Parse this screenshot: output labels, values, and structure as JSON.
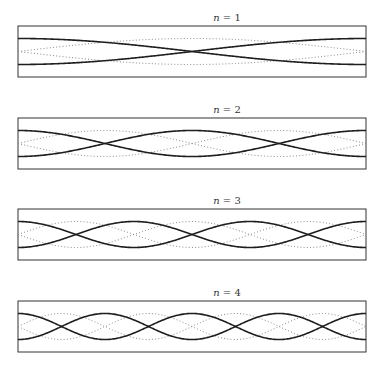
{
  "figure": {
    "width": 381,
    "height": 369,
    "box_left": 18,
    "box_right": 366,
    "box_height": 51,
    "amplitude": 13,
    "label_x": 227,
    "colors": {
      "solid": "#1e1e1e",
      "dotted": "#888888",
      "frame": "#333333"
    },
    "panels": [
      {
        "label_var": "n",
        "label_rest": " = 1",
        "n": 1,
        "box_top": 26,
        "label_y": 21
      },
      {
        "label_var": "n",
        "label_rest": " = 2",
        "n": 2,
        "box_top": 118,
        "label_y": 113
      },
      {
        "label_var": "n",
        "label_rest": " = 3",
        "n": 3,
        "box_top": 209,
        "label_y": 204
      },
      {
        "label_var": "n",
        "label_rest": " = 4",
        "n": 4,
        "box_top": 301,
        "label_y": 296
      }
    ]
  },
  "chart_data": {
    "type": "line",
    "title": "",
    "panels": [
      {
        "title": "n = 1",
        "series": [
          {
            "name": "solid (±cos)",
            "function": "±A·cos(1πx/L)"
          },
          {
            "name": "dotted (±sin)",
            "function": "±A·sin(1πx/L)"
          }
        ]
      },
      {
        "title": "n = 2",
        "series": [
          {
            "name": "solid (±cos)",
            "function": "±A·cos(2πx/L)"
          },
          {
            "name": "dotted (±sin)",
            "function": "±A·sin(2πx/L)"
          }
        ]
      },
      {
        "title": "n = 3",
        "series": [
          {
            "name": "solid (±cos)",
            "function": "±A·cos(3πx/L)"
          },
          {
            "name": "dotted (±sin)",
            "function": "±A·sin(3πx/L)"
          }
        ]
      },
      {
        "title": "n = 4",
        "series": [
          {
            "name": "solid (±cos)",
            "function": "±A·cos(4πx/L)"
          },
          {
            "name": "dotted (±sin)",
            "function": "±A·sin(4πx/L)"
          }
        ]
      }
    ],
    "xlabel": "",
    "ylabel": "",
    "grid": false,
    "legend": "none"
  }
}
